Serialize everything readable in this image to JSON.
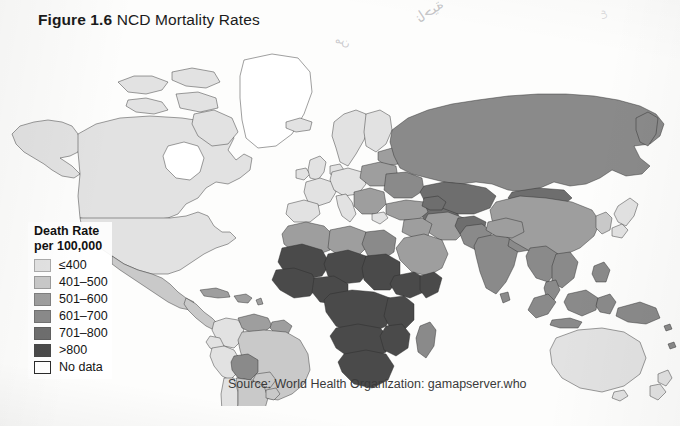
{
  "figure": {
    "number_label": "Figure 1.6",
    "title": "NCD Mortality Rates"
  },
  "source": {
    "text": "Source:  World Health Organization: gamapserver.who"
  },
  "annotations": {
    "bleed_through_arabic": "ناحية",
    "bleed_through_mark": "من",
    "bleed_through_mark2": "ع"
  },
  "legend": {
    "title_line1": "Death Rate",
    "title_line2": "per 100,000",
    "items": [
      {
        "label": "≤400",
        "color": "#e2e2e2",
        "class_index": 0
      },
      {
        "label": "401–500",
        "color": "#c9c9c9",
        "class_index": 1
      },
      {
        "label": "501–600",
        "color": "#9e9e9e",
        "class_index": 2
      },
      {
        "label": "601–700",
        "color": "#8a8a8a",
        "class_index": 3
      },
      {
        "label": "701–800",
        "color": "#6e6e6e",
        "class_index": 4
      },
      {
        "label": ">800",
        "color": "#4a4a4a",
        "class_index": 5
      },
      {
        "label": "No data",
        "color": "#ffffff",
        "class_index": 6
      }
    ]
  },
  "chart_data": {
    "type": "map",
    "title": "NCD Mortality Rates",
    "subtitle": "Death Rate per 100,000",
    "projection": "world-equirectangular-like",
    "value_unit": "deaths per 100,000 population",
    "grid": false,
    "legend_position": "lower-left",
    "classes": [
      {
        "label": "≤400",
        "min": 0,
        "max": 400,
        "color": "#e2e2e2"
      },
      {
        "label": "401–500",
        "min": 401,
        "max": 500,
        "color": "#c9c9c9"
      },
      {
        "label": "501–600",
        "min": 501,
        "max": 600,
        "color": "#9e9e9e"
      },
      {
        "label": "601–700",
        "min": 601,
        "max": 700,
        "color": "#8a8a8a"
      },
      {
        "label": "701–800",
        "min": 701,
        "max": 800,
        "color": "#6e6e6e"
      },
      {
        "label": ">800",
        "min": 801,
        "max": null,
        "color": "#4a4a4a"
      },
      {
        "label": "No data",
        "min": null,
        "max": null,
        "color": "#ffffff"
      }
    ],
    "regions": [
      {
        "name": "Canada",
        "class": "≤400",
        "color": "#e2e2e2"
      },
      {
        "name": "United States",
        "class": "≤400",
        "color": "#e2e2e2"
      },
      {
        "name": "Greenland",
        "class": "No data",
        "color": "#ffffff"
      },
      {
        "name": "Mexico",
        "class": "401–500",
        "color": "#c9c9c9"
      },
      {
        "name": "Central America",
        "class": "401–500",
        "color": "#c9c9c9"
      },
      {
        "name": "Caribbean",
        "class": "501–600",
        "color": "#9e9e9e"
      },
      {
        "name": "Colombia",
        "class": "≤400",
        "color": "#e2e2e2"
      },
      {
        "name": "Venezuela",
        "class": "501–600",
        "color": "#9e9e9e"
      },
      {
        "name": "Brazil",
        "class": "401–500",
        "color": "#c9c9c9"
      },
      {
        "name": "Bolivia",
        "class": "601–700",
        "color": "#8a8a8a"
      },
      {
        "name": "Peru",
        "class": "≤400",
        "color": "#e2e2e2"
      },
      {
        "name": "Argentina",
        "class": "401–500",
        "color": "#c9c9c9"
      },
      {
        "name": "Chile",
        "class": "≤400",
        "color": "#e2e2e2"
      },
      {
        "name": "Western Europe",
        "class": "≤400",
        "color": "#e2e2e2"
      },
      {
        "name": "Scandinavia",
        "class": "≤400",
        "color": "#e2e2e2"
      },
      {
        "name": "Eastern Europe",
        "class": "501–600",
        "color": "#9e9e9e"
      },
      {
        "name": "Russian Federation",
        "class": "601–700",
        "color": "#8a8a8a"
      },
      {
        "name": "Ukraine",
        "class": "601–700",
        "color": "#8a8a8a"
      },
      {
        "name": "Turkey",
        "class": "501–600",
        "color": "#9e9e9e"
      },
      {
        "name": "Kazakhstan",
        "class": "701–800",
        "color": "#6e6e6e"
      },
      {
        "name": "Central Asia",
        "class": "701–800",
        "color": "#6e6e6e"
      },
      {
        "name": "Iran",
        "class": "501–600",
        "color": "#9e9e9e"
      },
      {
        "name": "Arabian Peninsula",
        "class": "501–600",
        "color": "#9e9e9e"
      },
      {
        "name": "Egypt",
        "class": "601–700",
        "color": "#8a8a8a"
      },
      {
        "name": "North Africa",
        "class": "501–600",
        "color": "#9e9e9e"
      },
      {
        "name": "Sahel",
        "class": ">800",
        "color": "#4a4a4a"
      },
      {
        "name": "West Africa",
        "class": ">800",
        "color": "#4a4a4a"
      },
      {
        "name": "Central Africa",
        "class": ">800",
        "color": "#4a4a4a"
      },
      {
        "name": "East Africa",
        "class": ">800",
        "color": "#4a4a4a"
      },
      {
        "name": "Southern Africa",
        "class": ">800",
        "color": "#4a4a4a"
      },
      {
        "name": "Madagascar",
        "class": "601–700",
        "color": "#8a8a8a"
      },
      {
        "name": "India",
        "class": "601–700",
        "color": "#8a8a8a"
      },
      {
        "name": "Pakistan",
        "class": "601–700",
        "color": "#8a8a8a"
      },
      {
        "name": "Afghanistan",
        "class": "701–800",
        "color": "#6e6e6e"
      },
      {
        "name": "China",
        "class": "501–600",
        "color": "#9e9e9e"
      },
      {
        "name": "Mongolia",
        "class": "701–800",
        "color": "#6e6e6e"
      },
      {
        "name": "Southeast Asia",
        "class": "601–700",
        "color": "#8a8a8a"
      },
      {
        "name": "Indonesia",
        "class": "601–700",
        "color": "#8a8a8a"
      },
      {
        "name": "Papua New Guinea",
        "class": "601–700",
        "color": "#8a8a8a"
      },
      {
        "name": "Japan",
        "class": "≤400",
        "color": "#e2e2e2"
      },
      {
        "name": "Korea",
        "class": "401–500",
        "color": "#c9c9c9"
      },
      {
        "name": "Australia",
        "class": "≤400",
        "color": "#e2e2e2"
      },
      {
        "name": "New Zealand",
        "class": "≤400",
        "color": "#e2e2e2"
      }
    ]
  }
}
